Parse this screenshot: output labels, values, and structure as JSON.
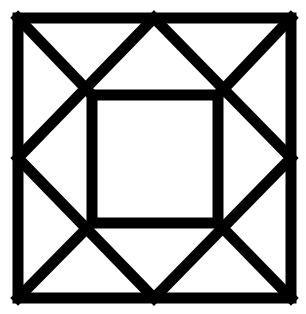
{
  "figure": {
    "stroke_color": "#000000",
    "background_color": "#ffffff",
    "stroke_width": 11,
    "outer_square": {
      "x1": 18,
      "y1": 18,
      "x2": 291,
      "y2": 298
    },
    "inner_square": {
      "x1": 92,
      "y1": 95,
      "x2": 218,
      "y2": 223
    },
    "diamond": {
      "top": [
        154,
        18
      ],
      "right": [
        291,
        158
      ],
      "bottom": [
        154,
        298
      ],
      "left": [
        18,
        158
      ]
    }
  }
}
